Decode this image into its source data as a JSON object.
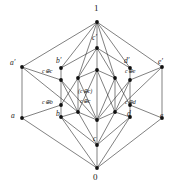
{
  "figure": {
    "kind": "hasse-diagram",
    "colors": {
      "background": "#ffffff",
      "edge": "#2b2b2b",
      "node": "#111111",
      "text": "#1a1a1a"
    }
  },
  "nodes": [
    {
      "id": "top",
      "label": "1",
      "x": 97,
      "y": 22,
      "lx": 94,
      "ly": 4,
      "size": "big",
      "style": "num"
    },
    {
      "id": "cprime",
      "label": "c′",
      "x": 97,
      "y": 48,
      "lx": 92,
      "ly": 34,
      "size": "mid",
      "style": "ital"
    },
    {
      "id": "mid-up",
      "label": "",
      "x": 97,
      "y": 70,
      "lx": 0,
      "ly": 0,
      "size": "mid",
      "style": "ital"
    },
    {
      "id": "mid-low",
      "label": "",
      "x": 97,
      "y": 120,
      "lx": 0,
      "ly": 0,
      "size": "mid",
      "style": "ital"
    },
    {
      "id": "c",
      "label": "c",
      "x": 97,
      "y": 145,
      "lx": 93,
      "ly": 135,
      "size": "mid",
      "style": "ital"
    },
    {
      "id": "bottom",
      "label": "0",
      "x": 97,
      "y": 168,
      "lx": 93,
      "ly": 173,
      "size": "big",
      "style": "num"
    },
    {
      "id": "aprime",
      "label": "a′",
      "x": 22,
      "y": 67,
      "lx": 10,
      "ly": 59,
      "size": "mid",
      "style": "ital"
    },
    {
      "id": "a",
      "label": "a",
      "x": 22,
      "y": 118,
      "lx": 11,
      "ly": 112,
      "size": "mid",
      "style": "ital"
    },
    {
      "id": "eprime",
      "label": "e′",
      "x": 162,
      "y": 67,
      "lx": 158,
      "ly": 58,
      "size": "mid",
      "style": "ital"
    },
    {
      "id": "e",
      "label": "e",
      "x": 162,
      "y": 118,
      "lx": 160,
      "ly": 112,
      "size": "mid",
      "style": "ital"
    },
    {
      "id": "bprime",
      "label": "b′",
      "x": 61,
      "y": 68,
      "lx": 56,
      "ly": 57,
      "size": "mid",
      "style": "ital"
    },
    {
      "id": "cxc1",
      "label": "c⊕c",
      "x": 61,
      "y": 80,
      "lx": 42,
      "ly": 68,
      "size": "small",
      "style": "ital"
    },
    {
      "id": "cxb",
      "label": "c⊕b",
      "x": 61,
      "y": 105,
      "lx": 42,
      "ly": 99,
      "size": "small",
      "style": "ital"
    },
    {
      "id": "b",
      "label": "b",
      "x": 61,
      "y": 117,
      "lx": 56,
      "ly": 110,
      "size": "mid",
      "style": "ital"
    },
    {
      "id": "dprime",
      "label": "d′",
      "x": 130,
      "y": 68,
      "lx": 124,
      "ly": 57,
      "size": "mid",
      "style": "ital"
    },
    {
      "id": "cxe",
      "label": "c⊕e",
      "x": 130,
      "y": 80,
      "lx": 125,
      "ly": 68,
      "size": "small",
      "style": "ital"
    },
    {
      "id": "cxd",
      "label": "c⊕d",
      "x": 130,
      "y": 105,
      "lx": 125,
      "ly": 99,
      "size": "small",
      "style": "ital"
    },
    {
      "id": "d",
      "label": "d",
      "x": 130,
      "y": 117,
      "lx": 127,
      "ly": 110,
      "size": "mid",
      "style": "ital"
    },
    {
      "id": "l-in-up",
      "label": "",
      "x": 78,
      "y": 78,
      "lx": 0,
      "ly": 0,
      "size": "mid",
      "style": "ital"
    },
    {
      "id": "l-in-lo",
      "label": "",
      "x": 78,
      "y": 112,
      "lx": 0,
      "ly": 0,
      "size": "mid",
      "style": "ital"
    },
    {
      "id": "r-in-up",
      "label": "",
      "x": 115,
      "y": 78,
      "lx": 0,
      "ly": 0,
      "size": "mid",
      "style": "ital"
    },
    {
      "id": "r-in-lo",
      "label": "",
      "x": 115,
      "y": 112,
      "lx": 0,
      "ly": 0,
      "size": "mid",
      "style": "ital"
    }
  ],
  "center_labels": [
    {
      "id": "cc-paren",
      "text": "(c⊕c)",
      "x": 78,
      "y": 88,
      "size": "small"
    },
    {
      "id": "cc-plain",
      "text": "c⊕c",
      "x": 80,
      "y": 98,
      "size": "small"
    }
  ],
  "edges": [
    [
      "top",
      "aprime"
    ],
    [
      "top",
      "bprime"
    ],
    [
      "top",
      "cprime"
    ],
    [
      "top",
      "dprime"
    ],
    [
      "top",
      "eprime"
    ],
    [
      "top",
      "l-in-up"
    ],
    [
      "top",
      "r-in-up"
    ],
    [
      "cprime",
      "mid-up"
    ],
    [
      "cprime",
      "l-in-up"
    ],
    [
      "cprime",
      "r-in-up"
    ],
    [
      "cprime",
      "bprime"
    ],
    [
      "cprime",
      "dprime"
    ],
    [
      "aprime",
      "cxc1"
    ],
    [
      "aprime",
      "l-in-lo"
    ],
    [
      "aprime",
      "a"
    ],
    [
      "eprime",
      "cxe"
    ],
    [
      "eprime",
      "r-in-lo"
    ],
    [
      "eprime",
      "e"
    ],
    [
      "bprime",
      "cxc1"
    ],
    [
      "cxc1",
      "l-in-lo"
    ],
    [
      "cxc1",
      "mid-low"
    ],
    [
      "cxc1",
      "cxb"
    ],
    [
      "dprime",
      "cxe"
    ],
    [
      "cxe",
      "r-in-lo"
    ],
    [
      "cxe",
      "mid-low"
    ],
    [
      "cxe",
      "cxd"
    ],
    [
      "mid-up",
      "l-in-up"
    ],
    [
      "mid-up",
      "r-in-up"
    ],
    [
      "mid-up",
      "mid-low"
    ],
    [
      "mid-up",
      "l-in-lo"
    ],
    [
      "mid-up",
      "r-in-lo"
    ],
    [
      "l-in-up",
      "cxb"
    ],
    [
      "l-in-up",
      "l-in-lo"
    ],
    [
      "l-in-up",
      "mid-low"
    ],
    [
      "r-in-up",
      "cxd"
    ],
    [
      "r-in-up",
      "r-in-lo"
    ],
    [
      "r-in-up",
      "mid-low"
    ],
    [
      "l-in-lo",
      "c"
    ],
    [
      "r-in-lo",
      "c"
    ],
    [
      "mid-low",
      "c"
    ],
    [
      "l-in-lo",
      "mid-low"
    ],
    [
      "r-in-lo",
      "mid-low"
    ],
    [
      "cxb",
      "b"
    ],
    [
      "cxd",
      "d"
    ],
    [
      "a",
      "bottom"
    ],
    [
      "b",
      "bottom"
    ],
    [
      "c",
      "bottom"
    ],
    [
      "d",
      "bottom"
    ],
    [
      "e",
      "bottom"
    ],
    [
      "b",
      "c"
    ],
    [
      "d",
      "c"
    ],
    [
      "b",
      "l-in-lo"
    ],
    [
      "d",
      "r-in-lo"
    ],
    [
      "a",
      "cxb"
    ],
    [
      "e",
      "cxd"
    ]
  ]
}
